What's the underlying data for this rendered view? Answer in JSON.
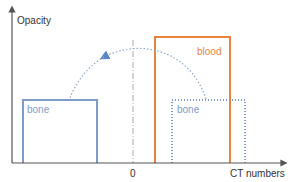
{
  "diagram": {
    "y_axis_label": "Opacity",
    "x_axis_label": "CT numbers",
    "zero_label": "0",
    "regions": [
      {
        "name": "blood",
        "label": "blood",
        "style": "solid",
        "color": "#e8823f"
      },
      {
        "name": "bone",
        "label": "bone",
        "style": "solid",
        "color": "#7f9cc8"
      },
      {
        "name": "bone-mirrored",
        "label": "bone",
        "style": "dotted",
        "color": "#7f9cc8"
      }
    ],
    "arrow": {
      "from": "bone-mirrored",
      "to": "bone",
      "style": "dotted",
      "color": "#7f9cc8"
    }
  }
}
